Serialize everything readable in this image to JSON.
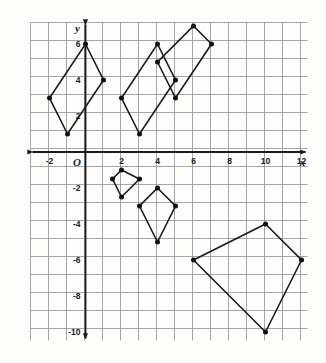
{
  "figure": {
    "background_color": "#fdfdfc",
    "grid_color": "#8e8e96",
    "axis_color": "#1a1a1a",
    "shape_color": "#1a1a1a",
    "vertex_color": "#111111"
  },
  "axes": {
    "x_label": "x",
    "y_label": "y",
    "origin_label": "O",
    "x_ticks": [
      {
        "value": -2,
        "label": "-2"
      },
      {
        "value": 2,
        "label": "2"
      },
      {
        "value": 4,
        "label": "4"
      },
      {
        "value": 6,
        "label": "6"
      },
      {
        "value": 8,
        "label": "8"
      },
      {
        "value": 10,
        "label": "10"
      },
      {
        "value": 12,
        "label": "12"
      }
    ],
    "y_ticks": [
      {
        "value": 6,
        "label": "6"
      },
      {
        "value": 4,
        "label": "4"
      },
      {
        "value": 2,
        "label": "2"
      },
      {
        "value": -2,
        "label": "-2"
      },
      {
        "value": -4,
        "label": "-4"
      },
      {
        "value": -6,
        "label": "-6"
      },
      {
        "value": -8,
        "label": "-8"
      },
      {
        "value": -10,
        "label": "-10"
      }
    ]
  },
  "chart_data": {
    "type": "scatter",
    "xlabel": "x",
    "ylabel": "y",
    "xlim": [
      -3,
      13
    ],
    "ylim": [
      -11,
      8
    ],
    "grid": true,
    "legend": "none",
    "xticks": [
      -2,
      2,
      4,
      6,
      8,
      10,
      12
    ],
    "yticks": [
      6,
      4,
      2,
      -2,
      -4,
      -6,
      -8,
      -10
    ],
    "x_tick_step": 1,
    "y_tick_step": 1,
    "series": [
      {
        "name": "quadrilateral-1",
        "closed": true,
        "points": [
          [
            0,
            6
          ],
          [
            1,
            4
          ],
          [
            -1,
            1
          ],
          [
            -2,
            3
          ]
        ]
      },
      {
        "name": "quadrilateral-2",
        "closed": true,
        "points": [
          [
            4,
            6
          ],
          [
            5,
            4
          ],
          [
            3,
            1
          ],
          [
            2,
            3
          ]
        ]
      },
      {
        "name": "quadrilateral-3",
        "closed": true,
        "points": [
          [
            6,
            7
          ],
          [
            7,
            6
          ],
          [
            5,
            3
          ],
          [
            4,
            5
          ]
        ]
      },
      {
        "name": "quadrilateral-4",
        "closed": true,
        "points": [
          [
            2,
            -1
          ],
          [
            3,
            -1.5
          ],
          [
            2,
            -2.5
          ],
          [
            1.5,
            -1.5
          ]
        ]
      },
      {
        "name": "quadrilateral-5",
        "closed": true,
        "points": [
          [
            4,
            -2
          ],
          [
            5,
            -3
          ],
          [
            4,
            -5
          ],
          [
            3,
            -3
          ]
        ]
      },
      {
        "name": "quadrilateral-6",
        "closed": true,
        "points": [
          [
            10,
            -4
          ],
          [
            12,
            -6
          ],
          [
            10,
            -10
          ],
          [
            6,
            -6
          ]
        ]
      }
    ],
    "vertices": [
      [
        0,
        6
      ],
      [
        1,
        4
      ],
      [
        -1,
        1
      ],
      [
        -2,
        3
      ],
      [
        4,
        6
      ],
      [
        5,
        4
      ],
      [
        3,
        1
      ],
      [
        2,
        3
      ],
      [
        6,
        7
      ],
      [
        7,
        6
      ],
      [
        5,
        3
      ],
      [
        4,
        5
      ],
      [
        2,
        -1
      ],
      [
        3,
        -1.5
      ],
      [
        2,
        -2.5
      ],
      [
        1.5,
        -1.5
      ],
      [
        4,
        -2
      ],
      [
        5,
        -3
      ],
      [
        4,
        -5
      ],
      [
        3,
        -3
      ],
      [
        10,
        -4
      ],
      [
        12,
        -6
      ],
      [
        10,
        -10
      ],
      [
        6,
        -6
      ]
    ]
  }
}
